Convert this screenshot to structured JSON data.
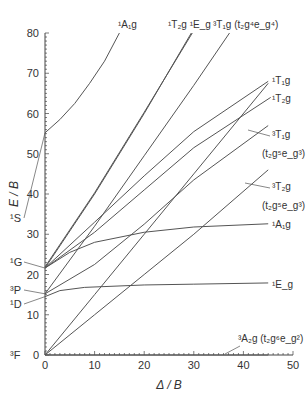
{
  "chart_data": {
    "type": "line",
    "title": "",
    "xlabel": "Δ / B",
    "ylabel": "E / B",
    "xlim": [
      0,
      50
    ],
    "ylim": [
      0,
      80
    ],
    "xticks": [
      0,
      10,
      20,
      30,
      40,
      50
    ],
    "yticks": [
      0,
      10,
      20,
      30,
      40,
      50,
      60,
      70,
      80
    ],
    "grid": false,
    "free_ion_terms": [
      {
        "label": "³F",
        "E": 0
      },
      {
        "label": "¹D",
        "E": 14.5
      },
      {
        "label": "³P",
        "E": 15.2
      },
      {
        "label": "¹G",
        "E": 21.6
      },
      {
        "label": "¹S",
        "E": 55.2
      }
    ],
    "series": [
      {
        "name": "¹A1g (upper)",
        "points": [
          [
            0,
            55.2
          ],
          [
            3,
            58.5
          ],
          [
            6,
            62.5
          ],
          [
            9,
            67.5
          ],
          [
            12,
            73
          ],
          [
            15,
            80
          ]
        ]
      },
      {
        "name": "¹T2g",
        "points": [
          [
            0,
            21.6
          ],
          [
            10,
            40
          ],
          [
            20,
            60
          ],
          [
            29.5,
            80
          ]
        ]
      },
      {
        "name": "¹Eg (steep)",
        "points": [
          [
            0,
            21.9
          ],
          [
            10,
            40.3
          ],
          [
            20,
            60.3
          ],
          [
            29.7,
            80
          ]
        ]
      },
      {
        "name": "³T1g (t2g4eg4)",
        "points": [
          [
            0,
            15.2
          ],
          [
            10,
            32
          ],
          [
            20,
            49.5
          ],
          [
            30,
            67
          ],
          [
            37.2,
            80
          ]
        ]
      },
      {
        "name": "¹T1g",
        "points": [
          [
            0,
            21.6
          ],
          [
            10,
            33
          ],
          [
            20,
            44.5
          ],
          [
            30,
            55.5
          ],
          [
            45,
            68
          ]
        ]
      },
      {
        "name": "¹T2g (lower)",
        "points": [
          [
            0,
            21.6
          ],
          [
            10,
            30.5
          ],
          [
            20,
            41
          ],
          [
            30,
            51.5
          ],
          [
            45.5,
            64
          ]
        ]
      },
      {
        "name": "³T1g (t2g5eg3)",
        "points": [
          [
            0,
            15.2
          ],
          [
            10,
            22.5
          ],
          [
            20,
            32.5
          ],
          [
            30,
            43.5
          ],
          [
            45,
            57
          ]
        ]
      },
      {
        "name": "³T2g (t2g5eg3)",
        "points": [
          [
            0,
            0
          ],
          [
            10,
            10
          ],
          [
            20,
            20
          ],
          [
            30,
            30
          ],
          [
            45,
            46
          ]
        ]
      },
      {
        "name": "¹A1g",
        "points": [
          [
            0,
            21.6
          ],
          [
            5,
            25.5
          ],
          [
            10,
            28
          ],
          [
            20,
            30.5
          ],
          [
            30,
            31.8
          ],
          [
            45,
            32.6
          ]
        ]
      },
      {
        "name": "¹Eg",
        "points": [
          [
            0,
            14.5
          ],
          [
            3,
            16
          ],
          [
            8,
            16.8
          ],
          [
            20,
            17.4
          ],
          [
            30,
            17.6
          ],
          [
            45,
            17.9
          ]
        ]
      },
      {
        "name": "³T1g from origin",
        "points": [
          [
            0,
            0
          ],
          [
            10,
            15
          ],
          [
            20,
            30
          ],
          [
            30,
            45
          ],
          [
            45,
            67.5
          ]
        ]
      },
      {
        "name": "³A2g (t2g6eg2)",
        "points": [
          [
            0,
            0
          ],
          [
            45,
            0
          ]
        ]
      }
    ],
    "labels": [
      {
        "text": "¹A₁g",
        "x": 15.5,
        "y": 82
      },
      {
        "text": "¹T₂g ¹E_g",
        "x": 28,
        "y": 82
      },
      {
        "text": "³T₁g (t₂g⁴e_g⁴)",
        "x": 36.5,
        "y": 82
      },
      {
        "text": "¹T₁g",
        "x": 46,
        "y": 69
      },
      {
        "text": "¹T₂g",
        "x": 46,
        "y": 65
      },
      {
        "text": "³T₁g (t₂g⁵e_g³)",
        "x": 46,
        "y": 55
      },
      {
        "text": "³T₂g (t₂g⁵e_g³)",
        "x": 46,
        "y": 45
      },
      {
        "text": "¹A₁g",
        "x": 46,
        "y": 32.5
      },
      {
        "text": "¹E_g",
        "x": 46,
        "y": 17.5
      },
      {
        "text": "³A₂g (t₂g⁶e_g²)",
        "x": 40,
        "y": 3
      }
    ]
  },
  "axis": {
    "x_title": "Δ / B",
    "y_title": "E / B",
    "x_tick_labels": [
      "0",
      "10",
      "20",
      "30",
      "40",
      "50"
    ],
    "y_tick_labels": [
      "0",
      "10",
      "20",
      "30",
      "40",
      "50",
      "60",
      "70",
      "80"
    ]
  },
  "style": {
    "line_color": "#555555",
    "axis_color": "#444444",
    "text_color": "#333333"
  }
}
